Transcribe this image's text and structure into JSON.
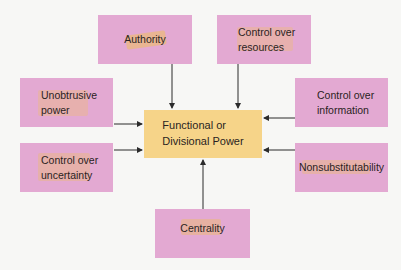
{
  "diagram": {
    "type": "hub-and-spoke",
    "center": {
      "line1": "Functional or",
      "line2": "Divisional Power",
      "color": "#f6d489"
    },
    "sources": [
      {
        "id": "authority",
        "line1": "Authority",
        "line2": ""
      },
      {
        "id": "control-over-resources",
        "line1": "Control over",
        "line2": "resources"
      },
      {
        "id": "unobtrusive-power",
        "line1": "Unobtrusive",
        "line2": "power"
      },
      {
        "id": "control-over-information",
        "line1": "Control over",
        "line2": "information"
      },
      {
        "id": "control-over-uncertainty",
        "line1": "Control over",
        "line2": "uncertainty"
      },
      {
        "id": "nonsubstitutability",
        "line1": "Nonsubstitutability",
        "line2": ""
      },
      {
        "id": "centrality",
        "line1": "Centrality",
        "line2": ""
      }
    ],
    "source_color": "#e3a9d2",
    "arrow_color": "#2b2b2b",
    "edges": [
      {
        "from": "authority",
        "to": "center"
      },
      {
        "from": "control-over-resources",
        "to": "center"
      },
      {
        "from": "unobtrusive-power",
        "to": "center"
      },
      {
        "from": "control-over-information",
        "to": "center"
      },
      {
        "from": "control-over-uncertainty",
        "to": "center"
      },
      {
        "from": "nonsubstitutability",
        "to": "center"
      },
      {
        "from": "centrality",
        "to": "center"
      }
    ]
  }
}
